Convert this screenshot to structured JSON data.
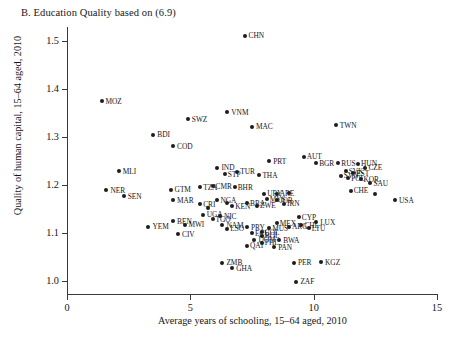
{
  "figure": {
    "panel_title": "B. Education Quality based on (6.9)"
  },
  "chart_data": {
    "type": "scatter",
    "title": "B. Education Quality based on (6.9)",
    "xlabel": "Average years of schooling, 15–64 aged, 2010",
    "ylabel": "Quality of human capital, 15–64 aged, 2010",
    "xlim": [
      0,
      15
    ],
    "ylim": [
      0.97,
      1.53
    ],
    "xticks": [
      0,
      5,
      10,
      15
    ],
    "xtick_labels": [
      "0",
      "5",
      "10",
      "15"
    ],
    "yticks": [
      1.0,
      1.1,
      1.2,
      1.3,
      1.4,
      1.5
    ],
    "ytick_labels": [
      "1.0",
      "1.1",
      "1.2",
      "1.3",
      "1.4",
      "1.5"
    ],
    "grid": false,
    "legend": null,
    "marker": "filled-circle",
    "marker_color": "#1d1d20",
    "points": [
      {
        "label": "CHN",
        "x": 7.2,
        "y": 1.512,
        "lx": 4
      },
      {
        "label": "MOZ",
        "x": 1.4,
        "y": 1.375,
        "lx": 4
      },
      {
        "label": "SWZ",
        "x": 4.9,
        "y": 1.337,
        "lx": 4
      },
      {
        "label": "TWN",
        "x": 10.9,
        "y": 1.325,
        "lx": 4
      },
      {
        "label": "VNM",
        "x": 6.5,
        "y": 1.352,
        "lx": 4
      },
      {
        "label": "MAC",
        "x": 7.5,
        "y": 1.322,
        "lx": 4
      },
      {
        "label": "BDI",
        "x": 3.5,
        "y": 1.305,
        "lx": 4
      },
      {
        "label": "COD",
        "x": 4.3,
        "y": 1.281,
        "lx": 4
      },
      {
        "label": "AUT",
        "x": 9.6,
        "y": 1.259,
        "lx": 3
      },
      {
        "label": "BGR",
        "x": 10.1,
        "y": 1.245,
        "lx": 3
      },
      {
        "label": "RUS",
        "x": 11.0,
        "y": 1.245,
        "lx": 3
      },
      {
        "label": "HUN",
        "x": 11.8,
        "y": 1.244,
        "lx": 3
      },
      {
        "label": "CZE",
        "x": 12.1,
        "y": 1.236,
        "lx": 3
      },
      {
        "label": "MLI",
        "x": 2.1,
        "y": 1.229,
        "lx": 4
      },
      {
        "label": "IND",
        "x": 6.1,
        "y": 1.236,
        "lx": 4
      },
      {
        "label": "PRT",
        "x": 8.2,
        "y": 1.249,
        "lx": 4
      },
      {
        "label": "SVK",
        "x": 11.3,
        "y": 1.229,
        "lx": 3
      },
      {
        "label": "EST",
        "x": 11.6,
        "y": 1.224,
        "lx": 3
      },
      {
        "label": "SVN",
        "x": 11.1,
        "y": 1.219,
        "lx": 3
      },
      {
        "label": "POL",
        "x": 11.4,
        "y": 1.214,
        "lx": 3
      },
      {
        "label": "STP",
        "x": 6.4,
        "y": 1.222,
        "lx": 3
      },
      {
        "label": "TUR",
        "x": 6.9,
        "y": 1.228,
        "lx": 3
      },
      {
        "label": "THA",
        "x": 7.8,
        "y": 1.22,
        "lx": 3
      },
      {
        "label": "KOR",
        "x": 11.9,
        "y": 1.212,
        "lx": 3
      },
      {
        "label": "SAU",
        "x": 12.3,
        "y": 1.204,
        "lx": 3
      },
      {
        "label": "NER",
        "x": 1.6,
        "y": 1.189,
        "lx": 4
      },
      {
        "label": "SEN",
        "x": 2.3,
        "y": 1.176,
        "lx": 4
      },
      {
        "label": "GTM",
        "x": 4.2,
        "y": 1.19,
        "lx": 4
      },
      {
        "label": "MAR",
        "x": 4.3,
        "y": 1.168,
        "lx": 4
      },
      {
        "label": "TZA",
        "x": 5.4,
        "y": 1.195,
        "lx": 3
      },
      {
        "label": "CMR",
        "x": 5.9,
        "y": 1.197,
        "lx": 3
      },
      {
        "label": "BHR",
        "x": 6.8,
        "y": 1.195,
        "lx": 3
      },
      {
        "label": "URY",
        "x": 8.0,
        "y": 1.182,
        "lx": 3
      },
      {
        "label": "ARE",
        "x": 8.5,
        "y": 1.182,
        "lx": 3
      },
      {
        "label": "HUN2",
        "x": 9.0,
        "y": 1.183,
        "lx": 3
      },
      {
        "label": "CHE",
        "x": 11.5,
        "y": 1.188,
        "lx": 3
      },
      {
        "label": "PER2",
        "x": 12.5,
        "y": 1.181,
        "lx": 3
      },
      {
        "label": "USA",
        "x": 13.3,
        "y": 1.168,
        "lx": 4
      },
      {
        "label": "NGA",
        "x": 6.1,
        "y": 1.168,
        "lx": 3
      },
      {
        "label": "ZAF2",
        "x": 6.5,
        "y": 1.162,
        "lx": 3
      },
      {
        "label": "KEN",
        "x": 6.7,
        "y": 1.155,
        "lx": 3
      },
      {
        "label": "BRA",
        "x": 7.3,
        "y": 1.162,
        "lx": 3
      },
      {
        "label": "ZWE",
        "x": 7.7,
        "y": 1.157,
        "lx": 3
      },
      {
        "label": "JOR",
        "x": 8.5,
        "y": 1.168,
        "lx": 3
      },
      {
        "label": "IRN",
        "x": 8.8,
        "y": 1.161,
        "lx": 3
      },
      {
        "label": "MYS",
        "x": 8.1,
        "y": 1.17,
        "lx": 3
      },
      {
        "label": "CRI",
        "x": 5.4,
        "y": 1.16,
        "lx": 3
      },
      {
        "label": "IRN2",
        "x": 5.7,
        "y": 1.152,
        "lx": 3
      },
      {
        "label": "UGA",
        "x": 5.5,
        "y": 1.138,
        "lx": 4
      },
      {
        "label": "NIC",
        "x": 6.2,
        "y": 1.135,
        "lx": 4
      },
      {
        "label": "TGO",
        "x": 5.9,
        "y": 1.128,
        "lx": 3
      },
      {
        "label": "BEN",
        "x": 4.3,
        "y": 1.124,
        "lx": 4
      },
      {
        "label": "MWI",
        "x": 4.8,
        "y": 1.117,
        "lx": 3
      },
      {
        "label": "YEM",
        "x": 3.3,
        "y": 1.113,
        "lx": 4
      },
      {
        "label": "NAM",
        "x": 6.3,
        "y": 1.116,
        "lx": 4
      },
      {
        "label": "LSO",
        "x": 6.5,
        "y": 1.108,
        "lx": 3
      },
      {
        "label": "CIV",
        "x": 4.5,
        "y": 1.097,
        "lx": 4
      },
      {
        "label": "CYP",
        "x": 9.4,
        "y": 1.132,
        "lx": 3
      },
      {
        "label": "LUX",
        "x": 10.1,
        "y": 1.122,
        "lx": 4
      },
      {
        "label": "CHL",
        "x": 9.5,
        "y": 1.116,
        "lx": 3
      },
      {
        "label": "LTU",
        "x": 9.8,
        "y": 1.109,
        "lx": 3
      },
      {
        "label": "MEX",
        "x": 8.5,
        "y": 1.12,
        "lx": 3
      },
      {
        "label": "MUS",
        "x": 8.2,
        "y": 1.11,
        "lx": 3
      },
      {
        "label": "ARG",
        "x": 9.0,
        "y": 1.113,
        "lx": 3
      },
      {
        "label": "COL",
        "x": 7.9,
        "y": 1.101,
        "lx": 3
      },
      {
        "label": "PRY",
        "x": 7.3,
        "y": 1.112,
        "lx": 4
      },
      {
        "label": "ECU",
        "x": 7.5,
        "y": 1.099,
        "lx": 3
      },
      {
        "label": "BOL",
        "x": 7.9,
        "y": 1.094,
        "lx": 3
      },
      {
        "label": "DOM",
        "x": 7.6,
        "y": 1.085,
        "lx": 4
      },
      {
        "label": "QAT",
        "x": 7.3,
        "y": 1.073,
        "lx": 3
      },
      {
        "label": "PHL",
        "x": 7.9,
        "y": 1.079,
        "lx": 3
      },
      {
        "label": "PAN",
        "x": 8.4,
        "y": 1.07,
        "lx": 4
      },
      {
        "label": "BWA",
        "x": 8.6,
        "y": 1.084,
        "lx": 4
      },
      {
        "label": "ZMB",
        "x": 6.3,
        "y": 1.037,
        "lx": 4
      },
      {
        "label": "GHA",
        "x": 6.7,
        "y": 1.026,
        "lx": 4
      },
      {
        "label": "PER",
        "x": 9.2,
        "y": 1.037,
        "lx": 4
      },
      {
        "label": "KGZ",
        "x": 10.3,
        "y": 1.038,
        "lx": 4
      },
      {
        "label": "ZAF",
        "x": 9.3,
        "y": 0.998,
        "lx": 4
      }
    ]
  }
}
